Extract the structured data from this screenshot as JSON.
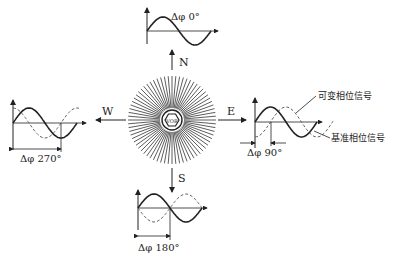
{
  "diagram": {
    "center": {
      "label": "VOR",
      "x": 172,
      "y": 120,
      "radius": 44,
      "rays": 72
    },
    "directions": [
      {
        "key": "N",
        "label": "N"
      },
      {
        "key": "E",
        "label": "E"
      },
      {
        "key": "S",
        "label": "S"
      },
      {
        "key": "W",
        "label": "W"
      }
    ],
    "plots": [
      {
        "direction": "N",
        "phase_label": "Δφ 0°",
        "phase_deg": 0
      },
      {
        "direction": "E",
        "phase_label": "Δφ 90°",
        "phase_deg": 90
      },
      {
        "direction": "S",
        "phase_label": "Δφ 180°",
        "phase_deg": 180
      },
      {
        "direction": "W",
        "phase_label": "Δφ 270°",
        "phase_deg": 270
      }
    ],
    "legend": {
      "variable_phase": "可变相位信号",
      "reference_phase": "基准相位信号"
    },
    "colors": {
      "stroke": "#222222",
      "dashed": "#777777",
      "background": "#ffffff"
    }
  }
}
